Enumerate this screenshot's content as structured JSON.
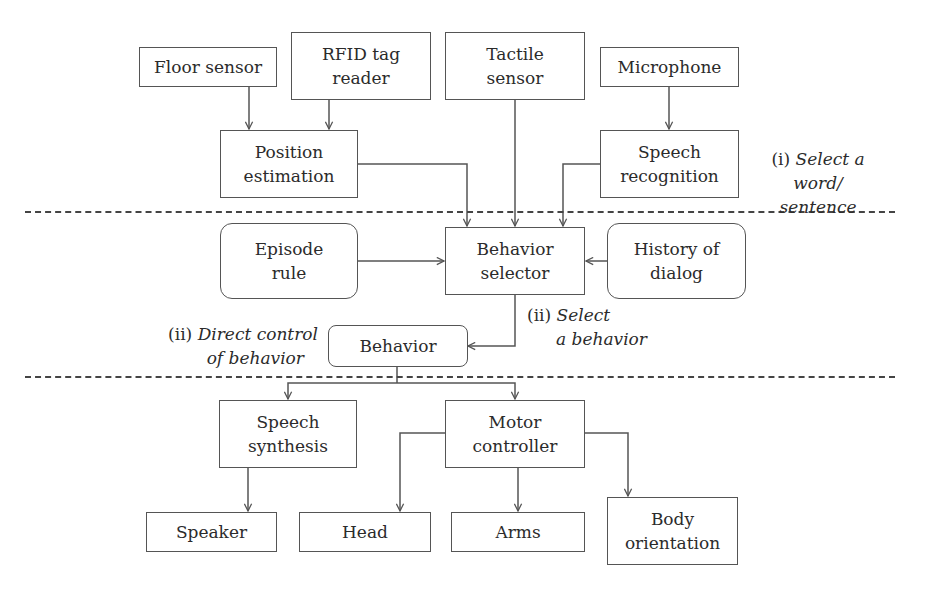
{
  "diagram": {
    "type": "robot-behavior-control-architecture",
    "layers": [
      "sensing/recognition",
      "behavior selection",
      "actuation"
    ],
    "nodes": {
      "floor_sensor": {
        "lines": [
          "Floor sensor"
        ],
        "shape": "rect"
      },
      "rfid_reader": {
        "lines": [
          "RFID tag",
          "reader"
        ],
        "shape": "rect"
      },
      "tactile_sensor": {
        "lines": [
          "Tactile",
          "sensor"
        ],
        "shape": "rect"
      },
      "microphone": {
        "lines": [
          "Microphone"
        ],
        "shape": "rect"
      },
      "position_estimation": {
        "lines": [
          "Position",
          "estimation"
        ],
        "shape": "rect"
      },
      "speech_recognition": {
        "lines": [
          "Speech",
          "recognition"
        ],
        "shape": "rect"
      },
      "episode_rule": {
        "lines": [
          "Episode",
          "rule"
        ],
        "shape": "rounded"
      },
      "behavior_selector": {
        "lines": [
          "Behavior",
          "selector"
        ],
        "shape": "rect"
      },
      "history_of_dialog": {
        "lines": [
          "History of",
          "dialog"
        ],
        "shape": "rounded"
      },
      "behavior": {
        "lines": [
          "Behavior"
        ],
        "shape": "rounded"
      },
      "speech_synthesis": {
        "lines": [
          "Speech",
          "synthesis"
        ],
        "shape": "rect"
      },
      "motor_controller": {
        "lines": [
          "Motor",
          "controller"
        ],
        "shape": "rect"
      },
      "speaker": {
        "lines": [
          "Speaker"
        ],
        "shape": "rect"
      },
      "head": {
        "lines": [
          "Head"
        ],
        "shape": "rect"
      },
      "arms": {
        "lines": [
          "Arms"
        ],
        "shape": "rect"
      },
      "body_orientation": {
        "lines": [
          "Body",
          "orientation"
        ],
        "shape": "rect"
      }
    },
    "annotations": {
      "select_word": {
        "prefix": "(i) ",
        "italic_line1": "Select a word/",
        "italic_line2": "sentence"
      },
      "direct_control": {
        "prefix": "(ii) ",
        "italic_line1": "Direct control",
        "italic_line2": "of behavior"
      },
      "select_behavior": {
        "prefix": "(ii) ",
        "italic_line1": "Select",
        "italic_line2": "a behavior"
      }
    },
    "edges": [
      {
        "from": "Floor sensor",
        "to": "Position estimation"
      },
      {
        "from": "RFID tag reader",
        "to": "Position estimation"
      },
      {
        "from": "Microphone",
        "to": "Speech recognition"
      },
      {
        "from": "Position estimation",
        "to": "Behavior selector"
      },
      {
        "from": "Tactile sensor",
        "to": "Behavior selector"
      },
      {
        "from": "Speech recognition",
        "to": "Behavior selector"
      },
      {
        "from": "Episode rule",
        "to": "Behavior selector"
      },
      {
        "from": "History of dialog",
        "to": "Behavior selector"
      },
      {
        "from": "Behavior selector",
        "to": "Behavior"
      },
      {
        "from": "Behavior",
        "to": "Speech synthesis"
      },
      {
        "from": "Behavior",
        "to": "Motor controller"
      },
      {
        "from": "Speech synthesis",
        "to": "Speaker"
      },
      {
        "from": "Motor controller",
        "to": "Head"
      },
      {
        "from": "Motor controller",
        "to": "Arms"
      },
      {
        "from": "Motor controller",
        "to": "Body orientation"
      }
    ]
  }
}
